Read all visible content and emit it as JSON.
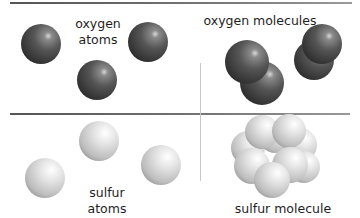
{
  "panels": {
    "oxygen_atoms": {
      "label_line1": "oxygen",
      "label_line2": "atoms"
    },
    "oxygen_molecules": {
      "label": "oxygen molecules"
    },
    "sulfur_atoms": {
      "label_line1": "sulfur",
      "label_line2": "atoms"
    },
    "sulfur_molecule": {
      "label": "sulfur molecule"
    }
  },
  "colors": {
    "oxygen": "#4a4a4a",
    "sulfur": "#d6d6d6",
    "divider": "#666666",
    "text": "#1e1e1e"
  }
}
